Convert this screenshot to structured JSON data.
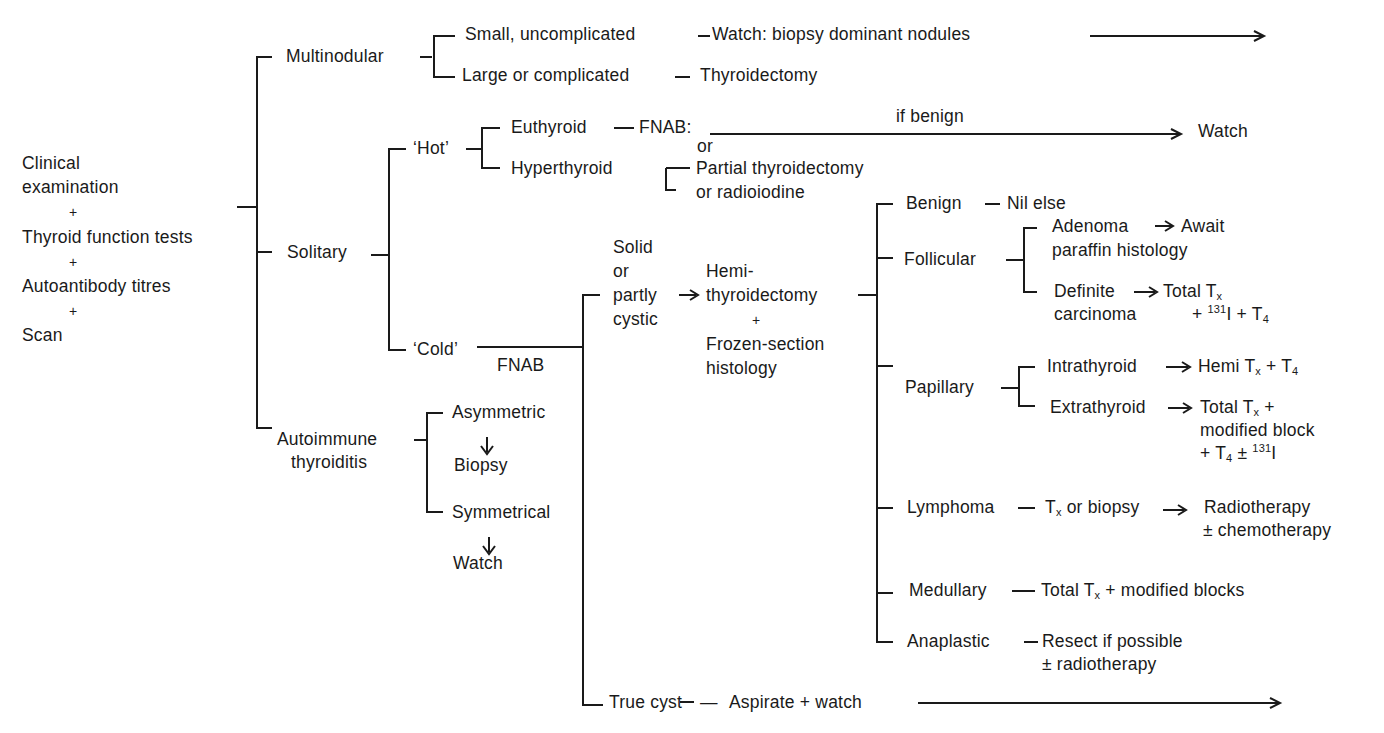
{
  "root": {
    "line1": "Clinical",
    "line2": "examination",
    "plus1": "+",
    "line3": "Thyroid function tests",
    "plus2": "+",
    "line4": "Autoantibody titres",
    "plus3": "+",
    "line5": "Scan"
  },
  "multinodular": {
    "label": "Multinodular",
    "small": "Small, uncomplicated",
    "small_action": "Watch: biopsy dominant nodules",
    "large": "Large or complicated",
    "large_action": "Thyroidectomy"
  },
  "solitary": {
    "label": "Solitary",
    "hot": {
      "label": "‘Hot’",
      "euthyroid": "Euthyroid",
      "fnab": "FNAB:",
      "or": "or",
      "if_benign": "if benign",
      "watch": "Watch",
      "hyperthyroid": "Hyperthyroid",
      "partial": "Partial thyroidectomy",
      "radio": "or radioiodine"
    },
    "cold": {
      "label": "‘Cold’",
      "fnab": "FNAB",
      "solid_1": "Solid",
      "solid_2": "or",
      "solid_3": "partly",
      "solid_4": "cystic",
      "hemi_1": "Hemi-",
      "hemi_2": "thyroidectomy",
      "hemi_plus": "+",
      "hemi_3": "Frozen-section",
      "hemi_4": "histology",
      "true_cyst": "True cyst",
      "aspirate": "Aspirate + watch"
    }
  },
  "autoimmune": {
    "label_1": "Autoimmune",
    "label_2": "thyroiditis",
    "asymmetric": "Asymmetric",
    "biopsy": "Biopsy",
    "symmetrical": "Symmetrical",
    "watch": "Watch"
  },
  "histology": {
    "benign": "Benign",
    "nil_else": "Nil else",
    "follicular": "Follicular",
    "adenoma": "Adenoma",
    "await_1": "Await",
    "await_2": "paraffin histology",
    "definite_1": "Definite",
    "definite_2": "carcinoma",
    "total_tx": "Total T",
    "total_tx_sub": "x",
    "fol_extra_a": "+ ",
    "fol_extra_sup": "131",
    "fol_extra_b": "I + T",
    "fol_extra_sub": "4",
    "papillary": "Papillary",
    "intrathyroid": "Intrathyroid",
    "hemi_tx_a": "Hemi T",
    "hemi_tx_sub": "x",
    "hemi_tx_b": " + T",
    "hemi_tx_sub2": "4",
    "extrathyroid": "Extrathyroid",
    "ext_1a": "Total T",
    "ext_1sub": "x",
    "ext_1b": " +",
    "ext_2": "modified block",
    "ext_3a": "+ T",
    "ext_3sub": "4",
    "ext_3b": " ± ",
    "ext_3sup": "131",
    "ext_3c": "I",
    "lymphoma": "Lymphoma",
    "lym_tx_a": "T",
    "lym_tx_sub": "x",
    "lym_tx_b": " or biopsy",
    "radiotherapy": "Radiotherapy",
    "chemo": "± chemotherapy",
    "medullary": "Medullary",
    "med_a": "Total T",
    "med_sub": "x",
    "med_b": " + modified blocks",
    "anaplastic": "Anaplastic",
    "resect": "Resect if possible",
    "radio": "± radiotherapy"
  },
  "connectors": {
    "dash": "—",
    "arrow_right": "→",
    "arrow_down": "↓"
  }
}
